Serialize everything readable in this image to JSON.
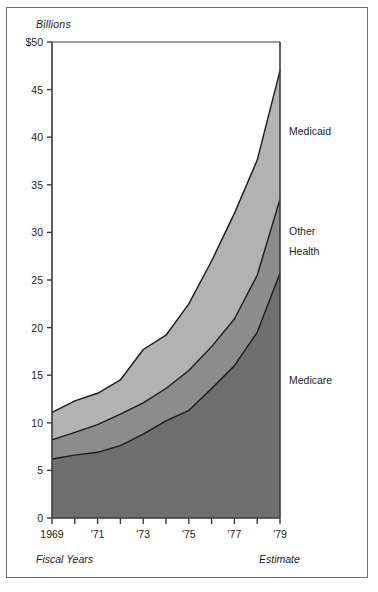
{
  "figure": {
    "unit_label": "Billions",
    "footer_left": "Fiscal Years",
    "footer_right": "Estimate"
  },
  "colors": {
    "medicaid_band": "#b2b2b2",
    "other_health_band": "#8c8c8c",
    "medicare_band": "#6f6f6f",
    "axis_line": "#3a3a3a",
    "frame": "#6f6f6f",
    "text": "#1c1c1c",
    "background": "#ffffff"
  },
  "chart_data": {
    "type": "area",
    "stacked": true,
    "title": "",
    "subtitle": "",
    "xlabel": "Fiscal Years",
    "ylabel": "Billions",
    "ylim": [
      0,
      50
    ],
    "xlim": [
      1969,
      1979
    ],
    "grid": false,
    "legend": "inline-right",
    "ytick_labels": [
      "$50",
      "45",
      "40",
      "35",
      "30",
      "25",
      "20",
      "15",
      "10",
      "5",
      "0"
    ],
    "ytick_values": [
      50,
      45,
      40,
      35,
      30,
      25,
      20,
      15,
      10,
      5,
      0
    ],
    "xtick_labels": [
      "1969",
      "'71",
      "'73",
      "'75",
      "'77",
      "'79"
    ],
    "xtick_values": [
      1969,
      1971,
      1973,
      1975,
      1977,
      1979
    ],
    "x": [
      1969,
      1970,
      1971,
      1972,
      1973,
      1974,
      1975,
      1976,
      1977,
      1978,
      1979
    ],
    "series": [
      {
        "name": "Medicare",
        "color": "#6f6f6f",
        "values": [
          6.2,
          6.6,
          6.9,
          7.6,
          8.8,
          10.2,
          11.3,
          13.6,
          16.0,
          19.5,
          25.7
        ]
      },
      {
        "name": "Other Health",
        "color": "#8c8c8c",
        "values": [
          2.0,
          2.4,
          2.9,
          3.3,
          3.3,
          3.4,
          4.2,
          4.4,
          4.9,
          6.0,
          7.8
        ]
      },
      {
        "name": "Medicaid",
        "color": "#b2b2b2",
        "values": [
          2.9,
          3.3,
          3.3,
          3.6,
          5.6,
          5.6,
          7.0,
          9.0,
          11.1,
          12.1,
          13.5
        ]
      }
    ],
    "cumulative_totals": [
      11.1,
      12.3,
      13.1,
      14.5,
      17.7,
      19.2,
      22.5,
      27.0,
      32.0,
      37.6,
      47.0
    ],
    "annotations": [
      {
        "text": "Medicaid",
        "x": 1979.3,
        "y": 40.5
      },
      {
        "text": "Other",
        "x": 1979.3,
        "y": 30.0
      },
      {
        "text": "Health",
        "x": 1979.3,
        "y": 27.9
      },
      {
        "text": "Medicare",
        "x": 1979.3,
        "y": 14.4
      }
    ]
  }
}
